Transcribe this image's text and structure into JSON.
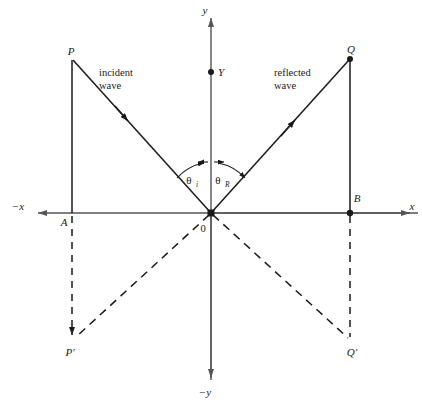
{
  "figure": {
    "type": "physics-ray-diagram",
    "topic": "reflection of a wave at a boundary",
    "background_color": "#ffffff",
    "stroke_color": "#1a1a1a",
    "axis_color": "#555555"
  },
  "axes": {
    "x_positive_label": "x",
    "x_negative_label": "−x",
    "y_positive_label": "y",
    "y_negative_label": "−y",
    "origin_label": "0"
  },
  "points": [
    {
      "id": "P",
      "label": "P",
      "x": 72,
      "y": 58,
      "dot": false
    },
    {
      "id": "Q",
      "label": "Q",
      "x": 350,
      "y": 58,
      "dot": true
    },
    {
      "id": "A",
      "label": "A",
      "x": 72,
      "y": 213,
      "dot": false
    },
    {
      "id": "B",
      "label": "B",
      "x": 350,
      "y": 213,
      "dot": true
    },
    {
      "id": "Y",
      "label": "Y",
      "x": 211,
      "y": 72,
      "dot": true
    },
    {
      "id": "O",
      "label": "0",
      "x": 211,
      "y": 213,
      "dot": true
    },
    {
      "id": "Pp",
      "label": "P′",
      "x": 72,
      "y": 340,
      "dot": true
    },
    {
      "id": "Qp",
      "label": "Q′",
      "x": 350,
      "y": 340,
      "dot": false
    }
  ],
  "rays": {
    "incident": {
      "label_line1": "incident",
      "label_line2": "wave",
      "from": "P",
      "to": "O",
      "style": "solid",
      "direction": "toward-origin"
    },
    "reflected": {
      "label_line1": "reflected",
      "label_line2": "wave",
      "from": "O",
      "to": "Q",
      "style": "solid",
      "direction": "away-from-origin"
    }
  },
  "angles": {
    "incident": {
      "symbol": "θ",
      "subscript": "i"
    },
    "reflected": {
      "symbol": "θ",
      "subscript": "R"
    }
  },
  "construction_lines": [
    {
      "name": "PA",
      "style": "solid",
      "from": "P",
      "to": "A"
    },
    {
      "name": "QB",
      "style": "solid",
      "from": "Q",
      "to": "B"
    },
    {
      "name": "AP-prime",
      "style": "dashed",
      "from": "A",
      "to": "P′"
    },
    {
      "name": "BQ-prime",
      "style": "dashed",
      "from": "B",
      "to": "Q′"
    },
    {
      "name": "O-to-P-prime",
      "style": "dashed",
      "from": "0",
      "to": "P′"
    },
    {
      "name": "O-to-Q-prime",
      "style": "dashed",
      "from": "0",
      "to": "Q′"
    }
  ],
  "caption": {
    "text": ""
  }
}
